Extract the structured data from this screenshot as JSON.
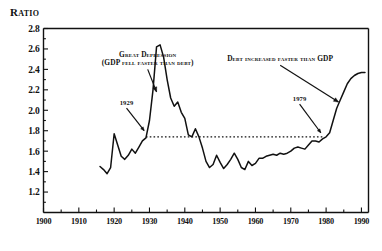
{
  "chart_data": {
    "type": "line",
    "title": "Ratio",
    "xlabel": "",
    "ylabel": "Ratio",
    "xlim": [
      1900,
      1992
    ],
    "ylim": [
      1.0,
      2.8
    ],
    "ytick_labels": [
      "2.8",
      "2.6",
      "2.4",
      "2.2",
      "2.0",
      "1.8",
      "1.6",
      "1.4",
      "1.2"
    ],
    "ytick_values": [
      2.8,
      2.6,
      2.4,
      2.2,
      2.0,
      1.8,
      1.6,
      1.4,
      1.2
    ],
    "ytick_minor_step": 0.1,
    "xtick_labels": [
      "1900",
      "1910",
      "1920",
      "1930",
      "1940",
      "1950",
      "1960",
      "1970",
      "1980",
      "1990"
    ],
    "xtick_values": [
      1900,
      1910,
      1920,
      1930,
      1940,
      1950,
      1960,
      1970,
      1980,
      1990
    ],
    "xtick_minor_step": 5,
    "grid": false,
    "legend": "none",
    "series": [
      {
        "name": "Debt to GDP ratio",
        "x": [
          1916,
          1917,
          1918,
          1919,
          1920,
          1921,
          1922,
          1923,
          1924,
          1925,
          1926,
          1927,
          1928,
          1929,
          1930,
          1931,
          1932,
          1933,
          1934,
          1935,
          1936,
          1937,
          1938,
          1939,
          1940,
          1941,
          1942,
          1943,
          1944,
          1945,
          1946,
          1947,
          1948,
          1949,
          1950,
          1951,
          1952,
          1953,
          1954,
          1955,
          1956,
          1957,
          1958,
          1959,
          1960,
          1961,
          1962,
          1963,
          1964,
          1965,
          1966,
          1967,
          1968,
          1969,
          1970,
          1971,
          1972,
          1973,
          1974,
          1975,
          1976,
          1977,
          1978,
          1979,
          1980,
          1981,
          1982,
          1983,
          1984,
          1985,
          1986,
          1987,
          1988,
          1989,
          1990,
          1991
        ],
        "y": [
          1.45,
          1.42,
          1.38,
          1.44,
          1.77,
          1.66,
          1.55,
          1.52,
          1.56,
          1.62,
          1.58,
          1.64,
          1.7,
          1.73,
          1.9,
          2.2,
          2.62,
          2.64,
          2.52,
          2.3,
          2.12,
          2.04,
          2.08,
          1.98,
          1.92,
          1.76,
          1.74,
          1.82,
          1.74,
          1.63,
          1.5,
          1.44,
          1.47,
          1.56,
          1.49,
          1.43,
          1.47,
          1.52,
          1.58,
          1.52,
          1.44,
          1.42,
          1.5,
          1.46,
          1.48,
          1.53,
          1.53,
          1.55,
          1.56,
          1.57,
          1.56,
          1.58,
          1.57,
          1.58,
          1.6,
          1.63,
          1.64,
          1.63,
          1.62,
          1.66,
          1.7,
          1.7,
          1.69,
          1.72,
          1.74,
          1.78,
          1.9,
          2.02,
          2.1,
          2.18,
          2.26,
          2.31,
          2.34,
          2.36,
          2.37,
          2.37
        ]
      }
    ],
    "reference_line": {
      "type": "horizontal-dotted",
      "y": 1.74,
      "x_start": 1929,
      "x_end": 1979
    },
    "annotations": [
      {
        "id": "great-depression",
        "text_line1": "Great Depression",
        "text_line2": "(GDP fell faster than debt)",
        "arrow_from": [
          1929.5,
          2.4
        ],
        "arrow_to": [
          1932.0,
          2.18
        ]
      },
      {
        "id": "debt-faster",
        "text_line1": "Debt increased faster than GDP",
        "arrow_from": [
          1967.0,
          2.44
        ],
        "arrow_to": [
          1983.5,
          2.08
        ]
      },
      {
        "id": "year-1929",
        "text_line1": "1929",
        "arrow_from": [
          1923.5,
          2.02
        ],
        "arrow_to": [
          1928.5,
          1.8
        ]
      },
      {
        "id": "year-1979",
        "text_line1": "1979",
        "arrow_from": [
          1972.5,
          2.06
        ],
        "arrow_to": [
          1978.5,
          1.78
        ]
      }
    ]
  },
  "colors": {
    "line": "#111111",
    "axis": "#111111",
    "background": "#ffffff"
  }
}
